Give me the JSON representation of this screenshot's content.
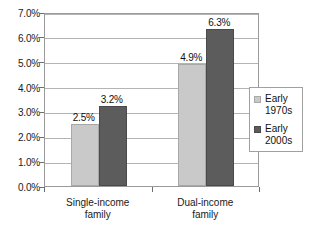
{
  "chart_data": {
    "type": "bar",
    "title": "",
    "subtitle": "",
    "xlabel": "",
    "ylabel": "",
    "grid": true,
    "legend_position": "right",
    "categories": [
      "Single-income\nfamily",
      "Dual-income\nfamily"
    ],
    "category_lines": [
      [
        "Single-income",
        "family"
      ],
      [
        "Dual-income",
        "family"
      ]
    ],
    "series": [
      {
        "name": "Early\n1970s",
        "name_lines": [
          "Early",
          "1970s"
        ],
        "color": "#c9c9c9",
        "values": [
          2.5,
          4.9
        ],
        "labels": [
          "2.5%",
          "4.9%"
        ]
      },
      {
        "name": "Early\n2000s",
        "name_lines": [
          "Early",
          "2000s"
        ],
        "color": "#5c5c5c",
        "values": [
          3.2,
          6.3
        ],
        "labels": [
          "3.2%",
          "6.3%"
        ]
      }
    ],
    "ylim": [
      0.0,
      7.0
    ],
    "ytick_step": 1.0,
    "ytick_labels": [
      "7.0%",
      "6.0%",
      "5.0%",
      "4.0%",
      "3.0%",
      "2.0%",
      "1.0%",
      "0.0%"
    ],
    "ytick_values": [
      7.0,
      6.0,
      5.0,
      4.0,
      3.0,
      2.0,
      1.0,
      0.0
    ]
  },
  "legend": {
    "entries": [
      {
        "label": "Early\n1970s",
        "swatch": "light-gray-swatch"
      },
      {
        "label": "Early\n2000s",
        "swatch": "dark-gray-swatch"
      }
    ]
  }
}
